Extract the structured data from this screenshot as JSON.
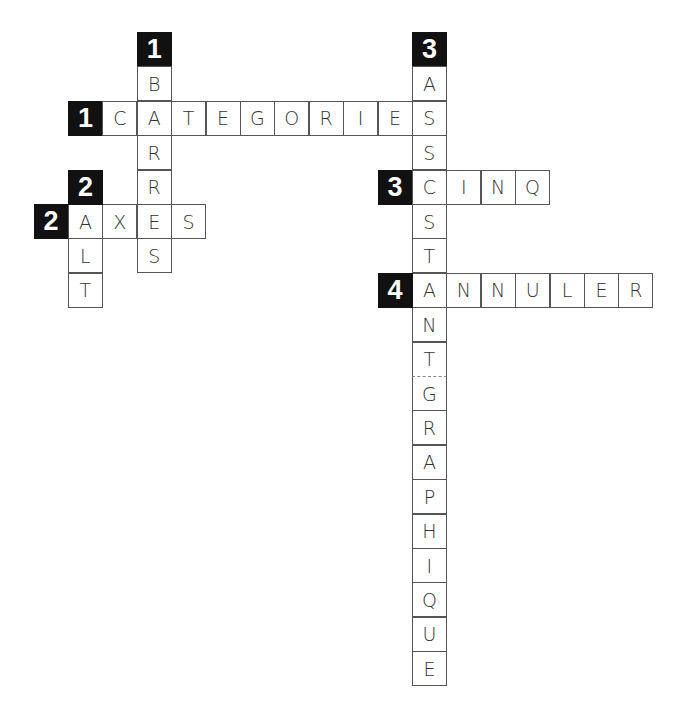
{
  "puzzle": {
    "type": "crossword",
    "grid": {
      "cell_size": 34.4,
      "origin_x": 33.5,
      "origin_y": 32
    },
    "entries": [
      {
        "number": "1",
        "direction": "across",
        "answer": "CATEGORIES",
        "clue_row": 2,
        "clue_col": 1
      },
      {
        "number": "1",
        "direction": "down",
        "answer": "BARRES",
        "clue_row": 0,
        "clue_col": 3
      },
      {
        "number": "2",
        "direction": "across",
        "answer": "AXES",
        "clue_row": 5,
        "clue_col": 0
      },
      {
        "number": "2",
        "direction": "down",
        "answer": "ALT",
        "clue_row": 4,
        "clue_col": 1
      },
      {
        "number": "3",
        "direction": "across",
        "answer": "CINQ",
        "clue_row": 4,
        "clue_col": 10
      },
      {
        "number": "3",
        "direction": "down",
        "answer": "ASSISTANTGRAPHIQUE",
        "clue_row": 0,
        "clue_col": 11
      },
      {
        "number": "4",
        "direction": "across",
        "answer": "ANNULER",
        "clue_row": 7,
        "clue_col": 10
      }
    ],
    "dashed_separator": {
      "row": 10,
      "col": 11,
      "note": "between ASSISTANT and GRAPHIQUE"
    }
  }
}
